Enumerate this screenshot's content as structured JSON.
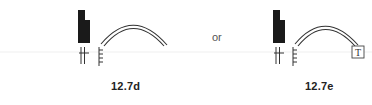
{
  "figures": [
    {
      "id": "12.7d",
      "label": "12.7d",
      "elements": [
        "black-block-notched",
        "double-bar-with-crossbar",
        "comb-tick-mark",
        "double-arc"
      ]
    },
    {
      "id": "12.7e",
      "label": "12.7e",
      "elements": [
        "black-block-notched",
        "double-bar-with-crossbar",
        "comb-tick-mark",
        "double-arc",
        "boxed-letter"
      ],
      "boxed_letter": "T"
    }
  ],
  "separator": "or",
  "colors": {
    "ink": "#1a1a1a",
    "faint_rule": "#e6e6e6",
    "label": "#222222"
  }
}
